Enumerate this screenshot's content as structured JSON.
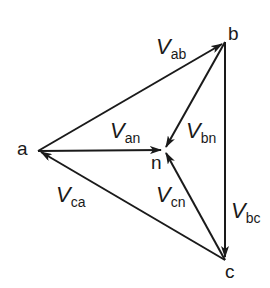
{
  "diagram": {
    "title": "",
    "nodes": [
      {
        "id": "a",
        "label": "a",
        "x": 38,
        "y": 151
      },
      {
        "id": "b",
        "label": "b",
        "x": 225,
        "y": 42
      },
      {
        "id": "c",
        "label": "c",
        "x": 225,
        "y": 260
      },
      {
        "id": "n",
        "label": "n",
        "x": 164,
        "y": 150
      }
    ],
    "vectors": [
      {
        "id": "Vab",
        "v": "V",
        "sub": "ab",
        "from": "a",
        "to": "b"
      },
      {
        "id": "Vbc",
        "v": "V",
        "sub": "bc",
        "from": "b",
        "to": "c"
      },
      {
        "id": "Vca",
        "v": "V",
        "sub": "ca",
        "from": "c",
        "to": "a"
      },
      {
        "id": "Van",
        "v": "V",
        "sub": "an",
        "from": "a",
        "to": "n"
      },
      {
        "id": "Vbn",
        "v": "V",
        "sub": "bn",
        "from": "b",
        "to": "n"
      },
      {
        "id": "Vcn",
        "v": "V",
        "sub": "cn",
        "from": "c",
        "to": "n"
      }
    ],
    "colors": {
      "stroke": "#1a1a1a",
      "background": "#ffffff"
    }
  }
}
